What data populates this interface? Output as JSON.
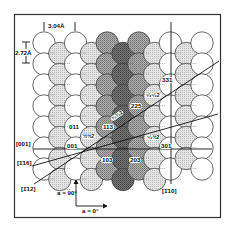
{
  "figure": {
    "dimensions": {
      "horizontal_spacing": "3.04Å",
      "vertical_spacing": "2.72Å"
    },
    "colors": {
      "frame": "#333333",
      "white_atom": "#ffffff",
      "light_atom": "#d8d8d8",
      "medium_atom": "#9a9a9a",
      "dark_atom": "#5e5e5e",
      "outline": "#444444"
    },
    "columns": [
      {
        "shade": "white",
        "offset": false
      },
      {
        "shade": "light",
        "offset": true
      },
      {
        "shade": "white",
        "offset": false
      },
      {
        "shade": "light",
        "offset": true
      },
      {
        "shade": "medium",
        "offset": false
      },
      {
        "shade": "dark",
        "offset": true
      },
      {
        "shade": "medium",
        "offset": false
      },
      {
        "shade": "light",
        "offset": true
      },
      {
        "shade": "white",
        "offset": false
      },
      {
        "shade": "light",
        "offset": true
      },
      {
        "shade": "white",
        "offset": false
      }
    ],
    "direction_labels": {
      "d001": "[001]",
      "d116": "[1̄16]",
      "d112": "[1̄12]",
      "d110": "[1̄10]"
    },
    "plane_labels": {
      "p011": "011",
      "p113": "113",
      "p001": "001",
      "p103": "103",
      "p203": "203",
      "p301": "301",
      "p331": "331",
      "p225": "225",
      "p_half_half_2": "½½2",
      "p_5half_half_2": "⁵⁄₂½2",
      "p_5half_5half_2": "⁵⁄₂⁵⁄₂2",
      "p_3half_3half_2": "³⁄₂³⁄₂2"
    },
    "angle_labels": {
      "a90": "a = 90°",
      "a0": "a = 0°"
    }
  }
}
